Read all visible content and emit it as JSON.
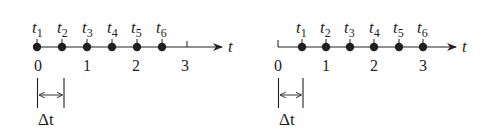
{
  "colors": {
    "ink": "#231f20",
    "background": "#ffffff"
  },
  "diagrams": [
    {
      "id": "left",
      "axis_variable": "t",
      "tick_labels": [
        "0",
        "1",
        "2",
        "3"
      ],
      "points": [
        {
          "name": "t",
          "sub": "1",
          "value": 0.0
        },
        {
          "name": "t",
          "sub": "2",
          "value": 0.5
        },
        {
          "name": "t",
          "sub": "3",
          "value": 1.0
        },
        {
          "name": "t",
          "sub": "4",
          "value": 1.5
        },
        {
          "name": "t",
          "sub": "5",
          "value": 2.0
        },
        {
          "name": "t",
          "sub": "6",
          "value": 2.5
        }
      ],
      "interval_label": "Δt"
    },
    {
      "id": "right",
      "axis_variable": "t",
      "tick_labels": [
        "0",
        "1",
        "2",
        "3"
      ],
      "points": [
        {
          "name": "t",
          "sub": "1",
          "value": 0.5
        },
        {
          "name": "t",
          "sub": "2",
          "value": 1.0
        },
        {
          "name": "t",
          "sub": "3",
          "value": 1.5
        },
        {
          "name": "t",
          "sub": "4",
          "value": 2.0
        },
        {
          "name": "t",
          "sub": "5",
          "value": 2.5
        },
        {
          "name": "t",
          "sub": "6",
          "value": 3.0
        }
      ],
      "interval_label": "Δt"
    }
  ]
}
